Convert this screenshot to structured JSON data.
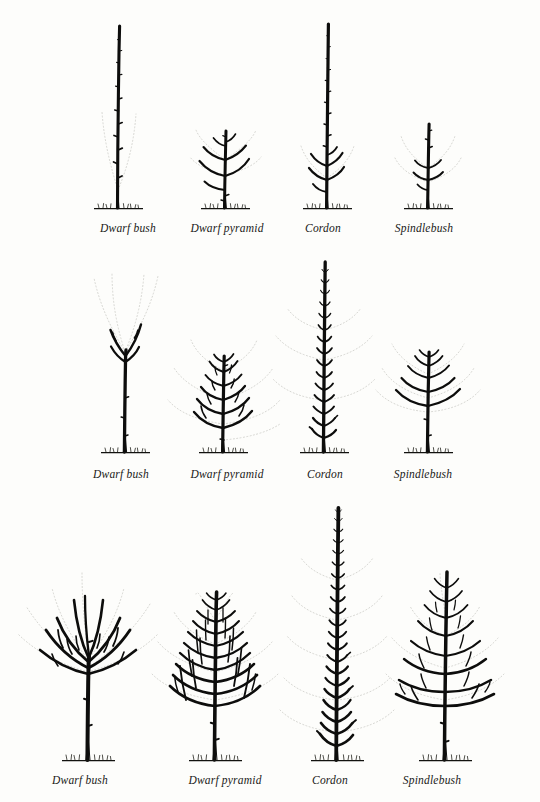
{
  "plate": {
    "title": "Tree forms and stages of growth",
    "background_color": "#fdfdfb",
    "ink_color": "#0d0d0c",
    "ghost_color": "#c9c9c4",
    "width": 540,
    "height": 802
  },
  "forms": [
    "Dwarf bush",
    "Dwarf pyramid",
    "Cordon",
    "Spindlebush"
  ],
  "rows": [
    {
      "stage": 1,
      "label_y": 232,
      "ground_y": 208,
      "figures": [
        {
          "form": "Dwarf bush",
          "label": "Dwarf bush",
          "label_x": 128,
          "cx": 118,
          "top_y": 24,
          "height": 184
        },
        {
          "form": "Dwarf pyramid",
          "label": "Dwarf pyramid",
          "label_x": 227,
          "cx": 225,
          "top_y": 128,
          "height": 80
        },
        {
          "form": "Cordon",
          "label": "Cordon",
          "label_x": 323,
          "cx": 327,
          "top_y": 24,
          "height": 184
        },
        {
          "form": "Spindlebush",
          "label": "Spindlebush",
          "label_x": 424,
          "cx": 428,
          "top_y": 122,
          "height": 86
        }
      ]
    },
    {
      "stage": 2,
      "label_y": 478,
      "ground_y": 452,
      "figures": [
        {
          "form": "Dwarf bush",
          "label": "Dwarf bush",
          "label_x": 121,
          "cx": 125,
          "top_y": 318,
          "height": 134
        },
        {
          "form": "Dwarf pyramid",
          "label": "Dwarf pyramid",
          "label_x": 227,
          "cx": 223,
          "top_y": 352,
          "height": 100
        },
        {
          "form": "Cordon",
          "label": "Cordon",
          "label_x": 325,
          "cx": 324,
          "top_y": 262,
          "height": 190
        },
        {
          "form": "Spindlebush",
          "label": "Spindlebush",
          "label_x": 423,
          "cx": 428,
          "top_y": 350,
          "height": 102
        }
      ]
    },
    {
      "stage": 3,
      "label_y": 784,
      "ground_y": 760,
      "figures": [
        {
          "form": "Dwarf bush",
          "label": "Dwarf bush",
          "label_x": 80,
          "cx": 88,
          "top_y": 568,
          "height": 192
        },
        {
          "form": "Dwarf pyramid",
          "label": "Dwarf pyramid",
          "label_x": 225,
          "cx": 215,
          "top_y": 592,
          "height": 168
        },
        {
          "form": "Cordon",
          "label": "Cordon",
          "label_x": 330,
          "cx": 337,
          "top_y": 508,
          "height": 252
        },
        {
          "form": "Spindlebush",
          "label": "Spindlebush",
          "label_x": 432,
          "cx": 445,
          "top_y": 572,
          "height": 188
        }
      ]
    }
  ]
}
